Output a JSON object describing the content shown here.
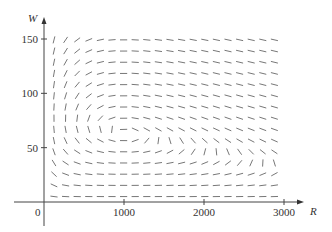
{
  "chart_data": {
    "type": "direction_field",
    "title": "",
    "xlabel": "R",
    "ylabel": "W",
    "xlim": [
      -1000,
      3000
    ],
    "ylim": [
      0,
      150
    ],
    "x_ticks": [
      {
        "value": 1000,
        "label": "1000"
      },
      {
        "value": 2000,
        "label": "2000"
      },
      {
        "value": 3000,
        "label": "3000"
      }
    ],
    "y_ticks": [
      {
        "value": 50,
        "label": "50"
      },
      {
        "value": 100,
        "label": "100"
      },
      {
        "value": 150,
        "label": "150"
      }
    ],
    "origin_label": "0",
    "grid": false,
    "equations": {
      "dR_dt": "0.08R(1 - 0.0002R) - 0.001RW",
      "dW_dt": "-0.02W + 0.00002RW"
    },
    "equilibrium": {
      "R": 1000,
      "W": 64
    },
    "field_grid": {
      "R_start": 125,
      "R_step": 145,
      "R_count": 20,
      "W_start": 5,
      "W_step": 10.3,
      "W_count": 15
    },
    "colors": {
      "segments": "#777777",
      "axes": "#444444",
      "text": "#333333"
    }
  }
}
